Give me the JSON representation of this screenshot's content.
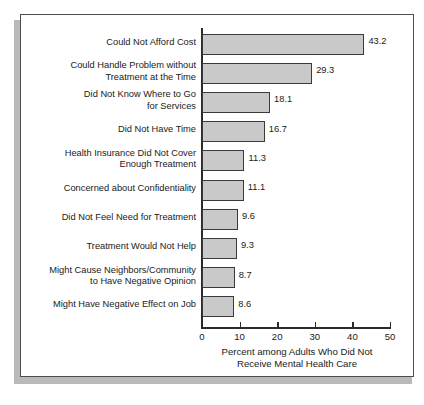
{
  "figure": {
    "frame_border_color": "#4d4d4d",
    "shadow_color": "#b9b9b9",
    "background_color": "#ffffff"
  },
  "chart_data": {
    "type": "bar",
    "orientation": "horizontal",
    "title": "",
    "xlabel": "Percent among Adults Who Did Not\nReceive Mental Health Care",
    "ylabel": "",
    "xlim": [
      0,
      50
    ],
    "xticks": [
      0,
      10,
      20,
      30,
      40,
      50
    ],
    "xtick_labels": [
      "0",
      "10",
      "20",
      "30",
      "40",
      "50"
    ],
    "grid": false,
    "legend": null,
    "bar_fill_color": "#c9c9c9",
    "bar_edge_color": "#3a3a3a",
    "categories": [
      "Could Not Afford Cost",
      "Could Handle Problem without\nTreatment at the Time",
      "Did Not Know Where to Go\nfor Services",
      "Did Not Have Time",
      "Health Insurance Did Not Cover\nEnough Treatment",
      "Concerned about Confidentiality",
      "Did Not Feel Need for Treatment",
      "Treatment Would Not Help",
      "Might Cause Neighbors/Community\nto Have Negative Opinion",
      "Might Have Negative Effect on Job"
    ],
    "values": [
      43.2,
      29.3,
      18.1,
      16.7,
      11.3,
      11.1,
      9.6,
      9.3,
      8.7,
      8.6
    ],
    "value_labels": [
      "43.2",
      "29.3",
      "18.1",
      "16.7",
      "11.3",
      "11.1",
      "9.6",
      "9.3",
      "8.7",
      "8.6"
    ]
  },
  "bottom_caption": ""
}
